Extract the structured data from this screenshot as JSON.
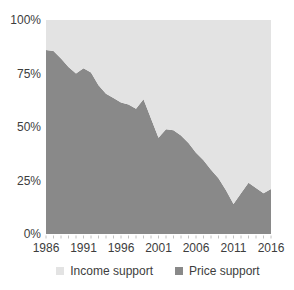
{
  "chart_data": {
    "type": "area",
    "stacked": true,
    "percent_stacked": true,
    "title": "",
    "xlabel": "",
    "ylabel": "",
    "x": [
      1986,
      1987,
      1988,
      1989,
      1990,
      1991,
      1992,
      1993,
      1994,
      1995,
      1996,
      1997,
      1998,
      1999,
      2000,
      2001,
      2002,
      2003,
      2004,
      2005,
      2006,
      2007,
      2008,
      2009,
      2010,
      2011,
      2012,
      2013,
      2014,
      2015,
      2016
    ],
    "xlim": [
      1986,
      2016
    ],
    "ylim": [
      0,
      100
    ],
    "grid": false,
    "series": [
      {
        "name": "Income support",
        "color": "#e3e3e3",
        "stack_position": "top",
        "values": [
          14,
          14.5,
          18,
          22,
          25,
          22.5,
          24.5,
          30.5,
          34.5,
          36.5,
          38.5,
          39.5,
          41.5,
          37,
          46,
          55,
          51,
          51.5,
          54,
          57.5,
          62,
          65.5,
          70,
          74,
          79.5,
          86,
          81,
          76,
          78.5,
          81,
          79
        ]
      },
      {
        "name": "Price support",
        "color": "#898989",
        "stack_position": "bottom",
        "values": [
          86,
          85.5,
          82,
          78,
          75,
          77.5,
          75.5,
          69.5,
          65.5,
          63.5,
          61.5,
          60.5,
          58.5,
          63,
          54,
          45,
          49,
          48.5,
          46,
          42.5,
          38,
          34.5,
          30,
          26,
          20.5,
          14,
          19,
          24,
          21.5,
          19,
          21
        ]
      }
    ],
    "yticks": [
      {
        "value": 100,
        "label": "100%"
      },
      {
        "value": 75,
        "label": "75%"
      },
      {
        "value": 50,
        "label": "50%"
      },
      {
        "value": 25,
        "label": "25%"
      },
      {
        "value": 0,
        "label": "0%"
      }
    ],
    "xticks": [
      {
        "value": 1986,
        "label": "1986"
      },
      {
        "value": 1991,
        "label": "1991"
      },
      {
        "value": 1996,
        "label": "1996"
      },
      {
        "value": 2001,
        "label": "2001"
      },
      {
        "value": 2006,
        "label": "2006"
      },
      {
        "value": 2011,
        "label": "2011"
      },
      {
        "value": 2016,
        "label": "2016"
      }
    ],
    "legend": [
      {
        "label": "Income support",
        "color": "#e3e3e3"
      },
      {
        "label": "Price support",
        "color": "#898989"
      }
    ],
    "legend_position": "bottom"
  },
  "colors": {
    "background": "#ffffff",
    "axis_text": "#3d3d3d",
    "tick_mark": "#c2c2c2"
  }
}
